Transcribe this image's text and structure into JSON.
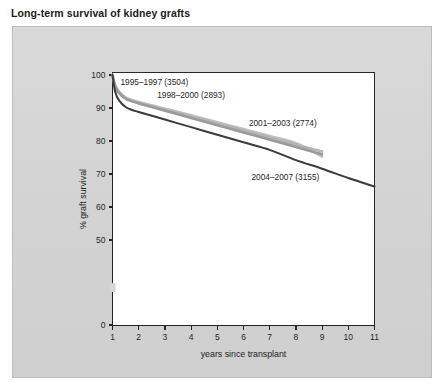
{
  "figure": {
    "title": "Long-term survival of kidney grafts"
  },
  "chart_data": {
    "type": "line",
    "title": "Long-term survival of kidney grafts",
    "xlabel": "years since transplant",
    "ylabel": "% graft survival",
    "xlim": [
      1,
      11
    ],
    "ylim": [
      0,
      100
    ],
    "xticks": [
      1,
      2,
      3,
      4,
      5,
      6,
      7,
      8,
      9,
      10,
      11
    ],
    "yticks": [
      0,
      50,
      60,
      70,
      80,
      90,
      100
    ],
    "y_axis_break": true,
    "y_axis_break_between": [
      0,
      50
    ],
    "grid": false,
    "legend_position": "inline-annotations",
    "series": [
      {
        "name": "1995-1997 (3504)",
        "label": "1995–1997 (3504)",
        "cohort": "1995-1997",
        "n": 3504,
        "color": "#9a9a9a",
        "x": [
          1.0,
          1.1,
          1.25,
          1.5,
          1.75,
          2,
          3,
          4,
          5,
          6,
          7,
          8,
          9,
          10,
          11
        ],
        "y": [
          100,
          96.5,
          94.5,
          92.8,
          92.0,
          91.4,
          89.2,
          87.0,
          84.8,
          82.6,
          80.4,
          78.2,
          76.0,
          null,
          null
        ],
        "label_x": 2.6,
        "label_y": 97.0
      },
      {
        "name": "1998-2000 (2893)",
        "label": "1998–2000 (2893)",
        "cohort": "1998-2000",
        "n": 2893,
        "color": "#b4b4b4",
        "x": [
          1.0,
          1.1,
          1.25,
          1.5,
          1.75,
          2,
          3,
          4,
          5,
          6,
          7,
          8,
          9,
          10,
          11
        ],
        "y": [
          100,
          96.8,
          94.8,
          93.0,
          92.2,
          91.6,
          89.5,
          87.4,
          85.3,
          83.1,
          81.0,
          78.9,
          76.8,
          null,
          null
        ],
        "label_x": 4.0,
        "label_y": 93.0
      },
      {
        "name": "2001-2003 (2774)",
        "label": "2001–2003 (2774)",
        "cohort": "2001-2003",
        "n": 2774,
        "color": "#bfbfbf",
        "x": [
          1.0,
          1.1,
          1.25,
          1.5,
          1.75,
          2,
          3,
          4,
          5,
          6,
          7,
          8,
          9,
          10,
          11
        ],
        "y": [
          100,
          97.0,
          95.0,
          93.2,
          92.4,
          91.8,
          89.8,
          87.8,
          85.7,
          83.6,
          81.5,
          79.3,
          75.3,
          null,
          null
        ],
        "label_x": 7.5,
        "label_y": 84.5
      },
      {
        "name": "2004-2007 (3155)",
        "label": "2004–2007 (3155)",
        "cohort": "2004-2007",
        "n": 3155,
        "color": "#3b3b3b",
        "x": [
          1.0,
          1.1,
          1.25,
          1.5,
          1.75,
          2,
          3,
          4,
          5,
          6,
          7,
          8,
          9,
          10,
          11
        ],
        "y": [
          100,
          95.0,
          92.3,
          90.3,
          89.4,
          88.8,
          86.5,
          84.2,
          81.9,
          79.6,
          77.3,
          74.2,
          71.6,
          68.8,
          66.2
        ],
        "label_x": 7.6,
        "label_y": 68.3
      }
    ]
  }
}
